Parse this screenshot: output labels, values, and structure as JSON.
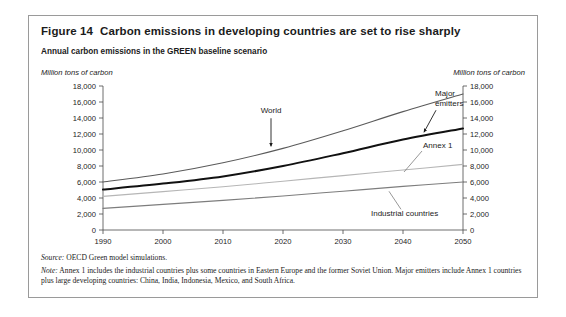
{
  "figure": {
    "number": "Figure 14",
    "title": "Carbon emissions in developing countries are set to rise sharply",
    "subtitle": "Annual carbon emissions in the GREEN baseline scenario",
    "unit_left": "Million tons of carbon",
    "unit_right": "Million tons of carbon",
    "source_lead": "Source:",
    "source_text": " OECD Green model simulations.",
    "note_lead": "Note:",
    "note_text": " Annex 1 includes the industrial countries plus some countries in Eastern Europe and the former Soviet Union. Major emitters include Annex 1 countries plus large developing countries: China, India, Indonesia, Mexico, and South Africa."
  },
  "chart_data": {
    "type": "line",
    "title": "Annual carbon emissions in the GREEN baseline scenario",
    "xlabel": "",
    "ylabel": "Million tons of carbon",
    "xlim": [
      1990,
      2050
    ],
    "ylim": [
      0,
      18000
    ],
    "ytick_step": 2000,
    "grid": false,
    "legend": "annotated-inline",
    "x": [
      1990,
      2000,
      2010,
      2020,
      2030,
      2040,
      2050
    ],
    "xticklabels": [
      "1990",
      "2000",
      "2010",
      "2020",
      "2030",
      "2040",
      "2050"
    ],
    "yticklabels": [
      "0",
      "2,000",
      "4,000",
      "6,000",
      "8,000",
      "10,000",
      "12,000",
      "14,000",
      "16,000",
      "18,000"
    ],
    "series": [
      {
        "name": "World",
        "color": "#5a5a5a",
        "width": 1.1,
        "values": [
          6000,
          7000,
          8400,
          10200,
          12400,
          14800,
          17000
        ]
      },
      {
        "name": "Major emitters",
        "color": "#111111",
        "width": 2.0,
        "values": [
          5050,
          5800,
          6700,
          8000,
          9600,
          11300,
          12700
        ]
      },
      {
        "name": "Annex 1",
        "color": "#b6b6b6",
        "width": 1.1,
        "values": [
          4200,
          4800,
          5400,
          6100,
          6800,
          7500,
          8200
        ]
      },
      {
        "name": "Industrial countries",
        "color": "#7d7d7d",
        "width": 1.1,
        "values": [
          2700,
          3200,
          3700,
          4250,
          4850,
          5450,
          6000
        ]
      }
    ],
    "annotations": [
      {
        "name": "World",
        "label": "World",
        "target_series": "World",
        "arrow": "down"
      },
      {
        "name": "Major emitters",
        "label_line1": "Major",
        "label_line2": "emitters",
        "target_series": "Major emitters",
        "arrow": "down-left"
      },
      {
        "name": "Annex 1",
        "label": "Annex 1",
        "target_series": "Annex 1",
        "arrow": "leader-up-left"
      },
      {
        "name": "Industrial countries",
        "label": "Industrial countries",
        "target_series": "Industrial countries",
        "arrow": "leader-up-left"
      }
    ]
  }
}
